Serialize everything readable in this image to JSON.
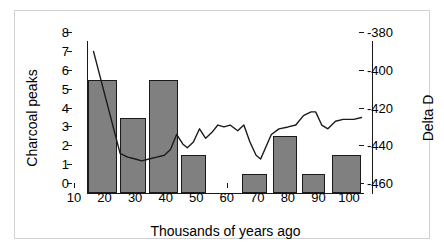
{
  "figure": {
    "background": "#ffffff",
    "frame_color": "#d2d2d2"
  },
  "chart_data": {
    "type": "bar",
    "title": "",
    "xlabel": "Thousands of years ago",
    "ylabel": "Charcoal peaks",
    "y2label": "Delta D",
    "xlim": [
      10,
      100
    ],
    "ylim": [
      0,
      8
    ],
    "y2lim": [
      -460,
      -380
    ],
    "grid": false,
    "legend": "none",
    "xticks": [
      10,
      20,
      30,
      40,
      50,
      60,
      70,
      80,
      90,
      100
    ],
    "xticklabels": [
      "10",
      "20",
      "30",
      "40",
      "50",
      "60",
      "70",
      "80",
      "90",
      "100"
    ],
    "yticks": [
      0,
      1,
      2,
      3,
      4,
      5,
      6,
      7,
      8
    ],
    "yticklabels": [
      "0",
      "1",
      "2",
      "3",
      "4",
      "5",
      "6",
      "7",
      "8"
    ],
    "y2ticks": [
      -460,
      -440,
      -420,
      -400,
      -380
    ],
    "y2ticklabels": [
      "-460",
      "-440",
      "-420",
      "-400",
      "-380"
    ],
    "series": [
      {
        "name": "Charcoal peaks",
        "type": "bar",
        "axis": "left",
        "color": "#808080",
        "edgecolor": "#1a1a1a",
        "bars": [
          {
            "x_start": 10,
            "x_end": 19.5,
            "value": 6
          },
          {
            "x_start": 20.5,
            "x_end": 29.0,
            "value": 4
          },
          {
            "x_start": 30.0,
            "x_end": 39.5,
            "value": 6
          },
          {
            "x_start": 40.5,
            "x_end": 48.5,
            "value": 2
          },
          {
            "x_start": 60.5,
            "x_end": 68.5,
            "value": 1
          },
          {
            "x_start": 70.5,
            "x_end": 78.5,
            "value": 3
          },
          {
            "x_start": 80.0,
            "x_end": 87.5,
            "value": 1
          },
          {
            "x_start": 90.0,
            "x_end": 99.5,
            "value": 2
          }
        ]
      },
      {
        "name": "Delta D",
        "type": "line",
        "axis": "right",
        "color": "#1a1a1a",
        "points": [
          {
            "x": 11.8,
            "y": -385
          },
          {
            "x": 20.5,
            "y": -439
          },
          {
            "x": 23.0,
            "y": -441
          },
          {
            "x": 25.5,
            "y": -442
          },
          {
            "x": 27.5,
            "y": -443
          },
          {
            "x": 30.0,
            "y": -442
          },
          {
            "x": 32.5,
            "y": -441
          },
          {
            "x": 35.0,
            "y": -440
          },
          {
            "x": 37.0,
            "y": -437
          },
          {
            "x": 39.0,
            "y": -429
          },
          {
            "x": 41.0,
            "y": -434
          },
          {
            "x": 42.5,
            "y": -436
          },
          {
            "x": 44.5,
            "y": -433
          },
          {
            "x": 46.5,
            "y": -426
          },
          {
            "x": 48.5,
            "y": -431
          },
          {
            "x": 50.5,
            "y": -428
          },
          {
            "x": 52.5,
            "y": -424
          },
          {
            "x": 54.5,
            "y": -425
          },
          {
            "x": 56.5,
            "y": -424
          },
          {
            "x": 59.0,
            "y": -427
          },
          {
            "x": 61.0,
            "y": -424
          },
          {
            "x": 63.0,
            "y": -433
          },
          {
            "x": 65.0,
            "y": -440
          },
          {
            "x": 66.5,
            "y": -442
          },
          {
            "x": 70.0,
            "y": -429
          },
          {
            "x": 72.5,
            "y": -426
          },
          {
            "x": 75.5,
            "y": -425
          },
          {
            "x": 78.0,
            "y": -424
          },
          {
            "x": 80.5,
            "y": -419
          },
          {
            "x": 83.0,
            "y": -417
          },
          {
            "x": 84.5,
            "y": -417
          },
          {
            "x": 86.5,
            "y": -424
          },
          {
            "x": 88.5,
            "y": -426
          },
          {
            "x": 91.0,
            "y": -422
          },
          {
            "x": 93.5,
            "y": -421
          },
          {
            "x": 97.0,
            "y": -421
          },
          {
            "x": 99.5,
            "y": -420
          }
        ]
      }
    ]
  }
}
